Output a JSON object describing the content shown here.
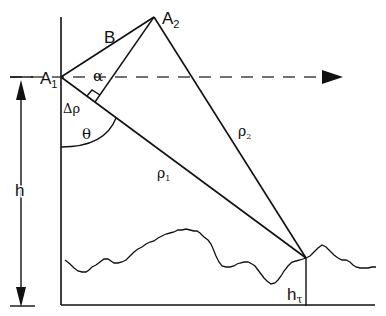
{
  "diagram": {
    "title": "",
    "labels": {
      "A1": "A",
      "A1_sub": "1",
      "A2": "A",
      "A2_sub": "2",
      "baseline_B": "B",
      "alpha": "α",
      "delta_rho": "Δρ",
      "theta": "θ",
      "rho1": "ρ",
      "rho1_sub": "1",
      "rho2": "ρ",
      "rho2_sub": "2",
      "h": "h",
      "h_tau": "h",
      "h_tau_sub": "τ"
    },
    "colors": {
      "line": "#111111",
      "dashed": "#444444",
      "background": "#ffffff"
    }
  }
}
